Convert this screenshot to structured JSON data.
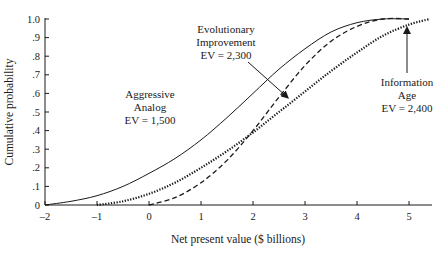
{
  "chart_data": {
    "type": "line",
    "title": "",
    "xlabel": "Net present value ($ billions)",
    "ylabel": "Cumulative probability",
    "xlim": [
      -2,
      5.5
    ],
    "ylim": [
      0,
      1.0
    ],
    "grid": false,
    "legend": "none (inline annotations)",
    "x_ticks": [
      "-2",
      "-1",
      "0",
      "1",
      "2",
      "3",
      "4",
      "5"
    ],
    "y_ticks": [
      "0",
      ".1",
      ".2",
      ".3",
      ".4",
      ".5",
      ".6",
      ".7",
      ".8",
      ".9",
      "1.0"
    ],
    "series": [
      {
        "name": "Aggressive Analog",
        "style": "solid",
        "ev": "EV = 1,500",
        "x": [
          -2.0,
          -1.5,
          -1.0,
          -0.5,
          0.0,
          0.5,
          1.0,
          1.5,
          2.0,
          2.5,
          3.0,
          3.5,
          4.0,
          4.5,
          5.0
        ],
        "y": [
          0.0,
          0.02,
          0.05,
          0.1,
          0.17,
          0.25,
          0.35,
          0.47,
          0.6,
          0.73,
          0.84,
          0.93,
          0.98,
          1.0,
          1.0
        ]
      },
      {
        "name": "Evolutionary Improvement",
        "style": "dashed",
        "ev": "EV = 2,300",
        "x": [
          0.0,
          0.5,
          1.0,
          1.5,
          2.0,
          2.5,
          3.0,
          3.5,
          4.0,
          4.5,
          5.0
        ],
        "y": [
          0.0,
          0.04,
          0.12,
          0.24,
          0.4,
          0.58,
          0.75,
          0.88,
          0.96,
          1.0,
          1.0
        ]
      },
      {
        "name": "Information Age",
        "style": "dotted-bold",
        "ev": "EV = 2,400",
        "x": [
          -1.0,
          -0.5,
          0.0,
          0.5,
          1.0,
          1.5,
          2.0,
          2.5,
          3.0,
          3.5,
          4.0,
          4.5,
          5.0,
          5.4
        ],
        "y": [
          0.0,
          0.02,
          0.06,
          0.12,
          0.2,
          0.29,
          0.39,
          0.5,
          0.61,
          0.72,
          0.82,
          0.91,
          0.97,
          1.0
        ]
      }
    ],
    "annotations": [
      {
        "lines": [
          "Evolutionary",
          "Improvement",
          "EV = 2,300"
        ],
        "points_to": "Evolutionary Improvement"
      },
      {
        "lines": [
          "Aggressive",
          "Analog",
          "EV = 1,500"
        ],
        "points_to": "Aggressive Analog"
      },
      {
        "lines": [
          "Information",
          "Age",
          "EV = 2,400"
        ],
        "points_to": "Information Age"
      }
    ]
  },
  "labels": {
    "xlabel": "Net present value ($ billions)",
    "ylabel": "Cumulative probability",
    "annot_evo_1": "Evolutionary",
    "annot_evo_2": "Improvement",
    "annot_evo_3": "EV = 2,300",
    "annot_agg_1": "Aggressive",
    "annot_agg_2": "Analog",
    "annot_agg_3": "EV = 1,500",
    "annot_info_1": "Information",
    "annot_info_2": "Age",
    "annot_info_3": "EV = 2,400"
  }
}
